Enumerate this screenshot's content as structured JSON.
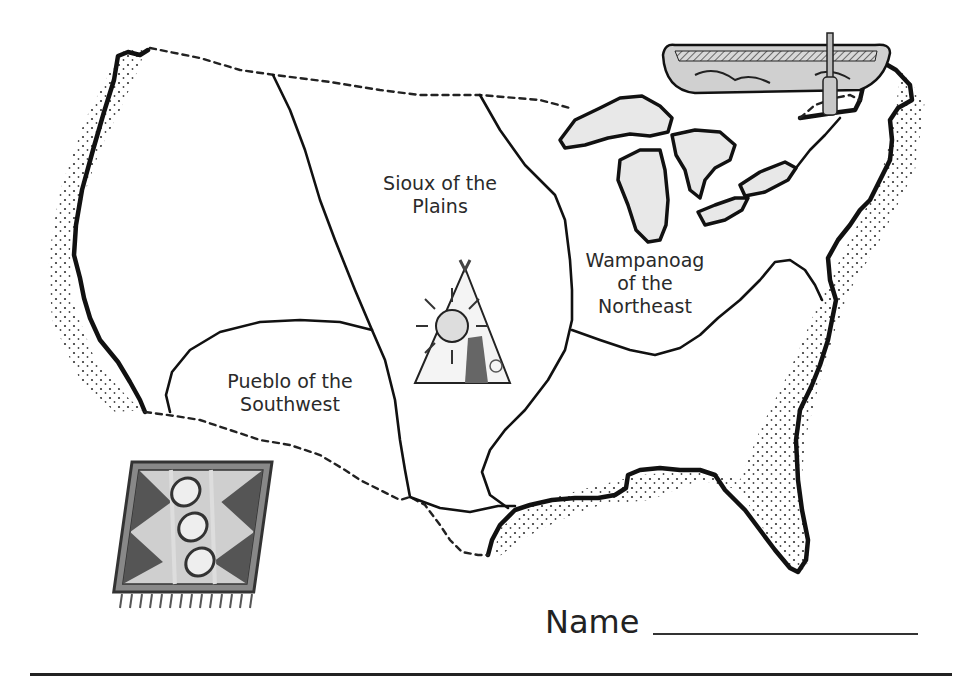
{
  "worksheet": {
    "title": "Native American Regions of the United States (map worksheet)",
    "name_field": {
      "label": "Name",
      "value": ""
    }
  },
  "map": {
    "regions": [
      {
        "id": "sioux",
        "label_line1": "Sioux of the",
        "label_line2": "Plains"
      },
      {
        "id": "wampanoag",
        "label_line1": "Wampanoag",
        "label_line2": "of the",
        "label_line3": "Northeast"
      },
      {
        "id": "pueblo",
        "label_line1": "Pueblo of the",
        "label_line2": "Southwest"
      }
    ],
    "illustrations": [
      {
        "id": "canoe",
        "icon": "canoe-icon",
        "region": "wampanoag"
      },
      {
        "id": "tipi",
        "icon": "tipi-icon",
        "region": "sioux"
      },
      {
        "id": "rug",
        "icon": "woven-rug-icon",
        "region": "pueblo"
      }
    ],
    "features": [
      "great-lakes",
      "coastline",
      "international-borders",
      "region-boundaries"
    ]
  },
  "colors": {
    "ink": "#111111",
    "text": "#2a2a2a",
    "paper": "#ffffff",
    "shade": "#bdbdbd"
  }
}
